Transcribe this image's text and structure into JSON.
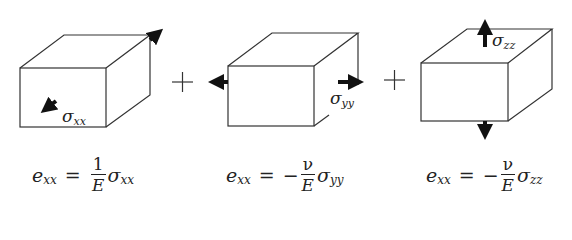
{
  "figure": {
    "operators": [
      "+",
      "+"
    ],
    "panels": [
      {
        "id": "xx",
        "stress_label_symbol": "σ",
        "stress_label_sub": "xx",
        "load_direction": "x (normal to front face)",
        "equation": {
          "lhs_symbol": "e",
          "lhs_sub": "xx",
          "equals": "=",
          "sign": "",
          "numerator": "1",
          "denominator": "E",
          "rhs_symbol": "σ",
          "rhs_sub": "xx"
        }
      },
      {
        "id": "yy",
        "stress_label_symbol": "σ",
        "stress_label_sub": "yy",
        "load_direction": "y (left-right)",
        "equation": {
          "lhs_symbol": "e",
          "lhs_sub": "xx",
          "equals": "=",
          "sign": "−",
          "numerator": "ν",
          "denominator": "E",
          "rhs_symbol": "σ",
          "rhs_sub": "yy"
        }
      },
      {
        "id": "zz",
        "stress_label_symbol": "σ",
        "stress_label_sub": "zz",
        "load_direction": "z (up-down)",
        "equation": {
          "lhs_symbol": "e",
          "lhs_sub": "xx",
          "equals": "=",
          "sign": "−",
          "numerator": "ν",
          "denominator": "E",
          "rhs_symbol": "σ",
          "rhs_sub": "zz"
        }
      }
    ]
  },
  "colors": {
    "line": "#333333",
    "arrow": "#111111",
    "background": "#ffffff"
  }
}
